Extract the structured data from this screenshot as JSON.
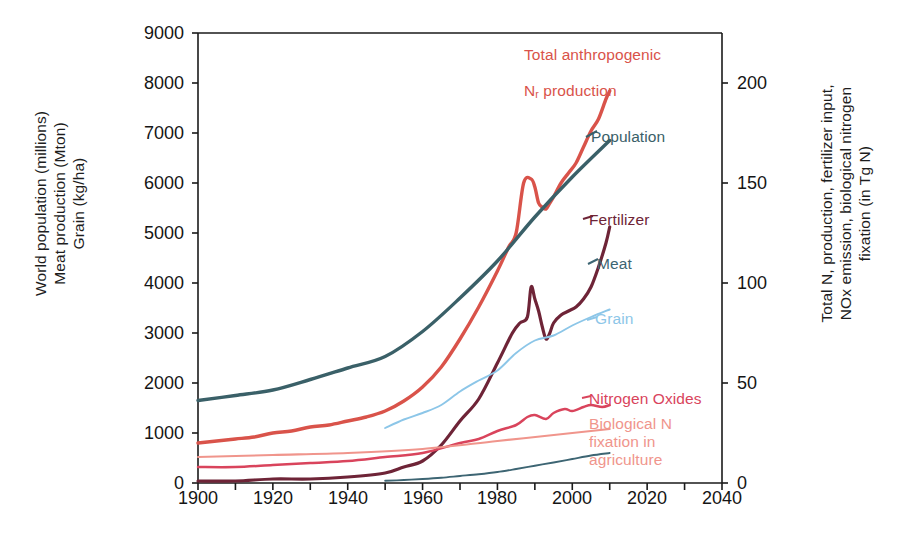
{
  "axes": {
    "left_title": "World population (millions)\nMeat production (Mton)\nGrain (kg/ha)",
    "right_title": "Total N, production, fertilizer input,\nNOx emission, biological nitrogen\nfixation (in Tg N)",
    "left_ticks": [
      "0",
      "1000",
      "2000",
      "3000",
      "4000",
      "5000",
      "6000",
      "7000",
      "8000",
      "9000"
    ],
    "right_ticks": [
      "0",
      "50",
      "100",
      "150",
      "200"
    ],
    "x_ticks": [
      "1900",
      "1920",
      "1940",
      "1960",
      "1980",
      "2000",
      "2020",
      "2040"
    ]
  },
  "labels": {
    "total_nr": "Total anthropogenic\nNᵣ production",
    "total_nr_line1": "Total anthropogenic",
    "total_nr_line2_pre": "N",
    "total_nr_line2_sub": "r",
    "total_nr_line2_post": " production",
    "population": "Population",
    "fertilizer": "Fertilizer",
    "meat": "Meat",
    "grain": "Grain",
    "nitrogen_oxides": "Nitrogen Oxides",
    "bnf": "Biological N\nfixation in\nagriculture"
  },
  "colors": {
    "total_nr": "#d9534a",
    "population": "#3a6068",
    "fertilizer": "#6e2437",
    "meat": "#3d6573",
    "grain": "#8cc6e8",
    "nitrogen_oxides": "#d9445c",
    "bnf": "#f0958c",
    "axis": "#1a1a1a",
    "text": "#151515"
  },
  "chart_data": {
    "type": "line",
    "title": "",
    "xlabel": "",
    "ylabel": "World population (millions) / Meat production (Mton) / Grain (kg/ha)",
    "y2label": "Total N, production, fertilizer input, NOx emission, biological nitrogen fixation (in Tg N)",
    "xlim": [
      1900,
      2040
    ],
    "ylim": [
      0,
      9000
    ],
    "y2lim": [
      0,
      225
    ],
    "grid": false,
    "legend": "inline-annotations",
    "note": "Left axis 0-9000 maps to right axis 0-225 (9000 left units = 225 Tg N).",
    "series": [
      {
        "name": "Total anthropogenic Nr production",
        "axis": "right",
        "units": "Tg N",
        "color": "#d9534a",
        "x": [
          1900,
          1905,
          1910,
          1915,
          1920,
          1925,
          1930,
          1935,
          1940,
          1945,
          1950,
          1955,
          1960,
          1965,
          1970,
          1975,
          1980,
          1983,
          1985,
          1987,
          1989,
          1990,
          1991,
          1992,
          1993,
          1994,
          1995,
          1997,
          1999,
          2001,
          2003,
          2005,
          2007,
          2009,
          2010
        ],
        "y": [
          20,
          21,
          22,
          23,
          25,
          26,
          28,
          29,
          31,
          33,
          36,
          41,
          48,
          58,
          72,
          88,
          106,
          118,
          125,
          150,
          152,
          148,
          140,
          138,
          137,
          140,
          143,
          150,
          155,
          160,
          168,
          176,
          182,
          192,
          196
        ]
      },
      {
        "name": "Population",
        "axis": "left",
        "units": "millions",
        "color": "#3a6068",
        "x": [
          1900,
          1910,
          1920,
          1930,
          1940,
          1950,
          1960,
          1970,
          1980,
          1990,
          2000,
          2010
        ],
        "y": [
          1650,
          1750,
          1860,
          2070,
          2300,
          2530,
          3030,
          3700,
          4440,
          5320,
          6120,
          6850
        ]
      },
      {
        "name": "Fertilizer",
        "axis": "right",
        "units": "Tg N",
        "color": "#6e2437",
        "x": [
          1900,
          1910,
          1920,
          1930,
          1940,
          1950,
          1955,
          1960,
          1965,
          1970,
          1975,
          1980,
          1984,
          1986,
          1988,
          1989,
          1990,
          1991,
          1992,
          1993,
          1994,
          1995,
          1997,
          1999,
          2001,
          2003,
          2005,
          2007,
          2009,
          2010
        ],
        "y": [
          1,
          1,
          2,
          2,
          3,
          5,
          8,
          11,
          19,
          31,
          42,
          60,
          75,
          80,
          83,
          98,
          92,
          86,
          78,
          72,
          75,
          80,
          84,
          86,
          88,
          92,
          98,
          108,
          120,
          128
        ]
      },
      {
        "name": "Meat",
        "axis": "left",
        "units": "Mton",
        "color": "#3d6573",
        "x": [
          1950,
          1955,
          1960,
          1965,
          1970,
          1975,
          1980,
          1985,
          1990,
          1995,
          2000,
          2005,
          2010
        ],
        "y": [
          45,
          60,
          80,
          105,
          140,
          175,
          220,
          280,
          345,
          410,
          480,
          550,
          600
        ]
      },
      {
        "name": "Grain",
        "axis": "left",
        "units": "kg/ha",
        "color": "#8cc6e8",
        "x": [
          1950,
          1955,
          1960,
          1965,
          1970,
          1975,
          1980,
          1985,
          1990,
          1995,
          2000,
          2005,
          2010
        ],
        "y": [
          1100,
          1270,
          1400,
          1560,
          1830,
          2050,
          2250,
          2600,
          2850,
          2950,
          3150,
          3320,
          3470
        ]
      },
      {
        "name": "Nitrogen Oxides",
        "axis": "right",
        "units": "Tg N",
        "color": "#d9445c",
        "x": [
          1900,
          1910,
          1920,
          1930,
          1940,
          1950,
          1960,
          1970,
          1975,
          1980,
          1985,
          1988,
          1990,
          1993,
          1995,
          1998,
          2000,
          2003,
          2005,
          2008,
          2010
        ],
        "y": [
          8,
          8,
          9,
          10,
          11,
          13,
          15,
          20,
          22,
          26,
          29,
          33,
          34,
          32,
          35,
          37,
          36,
          38,
          39,
          38,
          39
        ]
      },
      {
        "name": "Biological N fixation in agriculture",
        "axis": "right",
        "units": "Tg N",
        "color": "#f0958c",
        "x": [
          1900,
          1920,
          1940,
          1960,
          1980,
          2000,
          2010
        ],
        "y": [
          13,
          14,
          15,
          17,
          21,
          25,
          27
        ]
      }
    ]
  }
}
